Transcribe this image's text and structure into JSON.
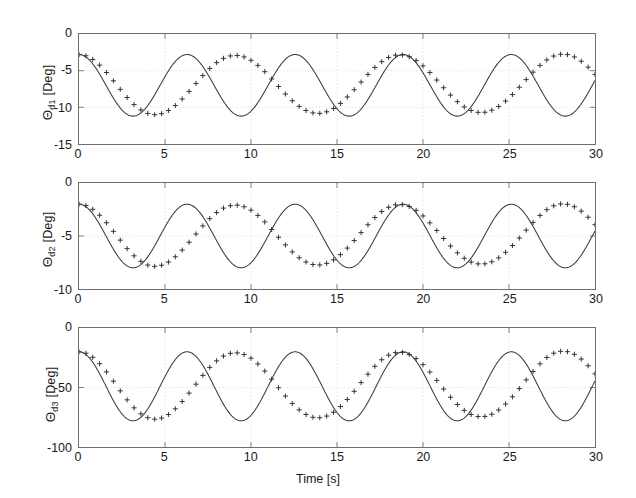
{
  "figure": {
    "background": "#ffffff",
    "axis_color": "#6f6f6f",
    "line_color": "#3a3a3a",
    "grid_color": "#cccccc",
    "marker": "plus"
  },
  "xaxis": {
    "label": "Time [s]",
    "ticks": [
      0,
      5,
      10,
      15,
      20,
      25,
      30
    ],
    "tick_labels": [
      "0",
      "5",
      "10",
      "15",
      "20",
      "25",
      "30"
    ],
    "min": 0,
    "max": 30
  },
  "subplots": [
    {
      "id": "subplot-theta-d1",
      "ylabel_theta": "Θ",
      "ylabel_sub": "d1",
      "ylabel_unit": " [Deg]",
      "ylabel_full": "Θd1 [Deg]",
      "ticks": [
        0,
        -5,
        -10,
        -15
      ],
      "tick_labels": [
        "0",
        "-5",
        "-10",
        "-15"
      ],
      "min": -15,
      "max": 0
    },
    {
      "id": "subplot-theta-d2",
      "ylabel_theta": "Θ",
      "ylabel_sub": "d2",
      "ylabel_unit": " [Deg]",
      "ylabel_full": "Θd2 [Deg]",
      "ticks": [
        0,
        -5,
        -10
      ],
      "tick_labels": [
        "0",
        "-5",
        "-10"
      ],
      "min": -10,
      "max": 0
    },
    {
      "id": "subplot-theta-d3",
      "ylabel_theta": "Θ",
      "ylabel_sub": "d3",
      "ylabel_unit": " [Deg]",
      "ylabel_full": "Θd3 [Deg]",
      "ticks": [
        0,
        -50,
        -100
      ],
      "tick_labels": [
        "0",
        "-50",
        "-100"
      ],
      "min": -100,
      "max": 0
    }
  ],
  "chart_data": [
    {
      "type": "line",
      "title": "",
      "xlabel": "Time [s]",
      "ylabel": "Θd1 [Deg]",
      "xlim": [
        0,
        30
      ],
      "ylim": [
        -15,
        0
      ],
      "xticks": [
        0,
        5,
        10,
        15,
        20,
        25,
        30
      ],
      "yticks": [
        0,
        -5,
        -10,
        -15
      ],
      "grid": true,
      "marker": "+",
      "legend": null,
      "waveform": {
        "shape": "sinusoid",
        "mean": -7.0,
        "amplitude": 4.2,
        "period": 6.283,
        "phase_deg": 90,
        "note": "y = -7.0 + 4.2*cos(2*pi*t/6.283); max -2.8, min -11.2"
      },
      "x": [
        0.0,
        0.4,
        0.8,
        1.2,
        1.6,
        2.0,
        2.4,
        2.8,
        3.2,
        3.6,
        4.0,
        4.4,
        4.8,
        5.2,
        5.6,
        6.0,
        6.4,
        6.8,
        7.2,
        7.6,
        8.0,
        8.4,
        8.8,
        9.2,
        9.6,
        10.0,
        10.4,
        10.8,
        11.2,
        11.6,
        12.0,
        12.4,
        12.8,
        13.2,
        13.6,
        14.0,
        14.4,
        14.8,
        15.2,
        15.6,
        16.0,
        16.4,
        16.8,
        17.2,
        17.6,
        18.0,
        18.4,
        18.8,
        19.2,
        19.6,
        20.0,
        20.4,
        20.8,
        21.2,
        21.6,
        22.0,
        22.4,
        22.8,
        23.2,
        23.6,
        24.0,
        24.4,
        24.8,
        25.2,
        25.6,
        26.0,
        26.4,
        26.8,
        27.2,
        27.6,
        28.0,
        28.4,
        28.8,
        29.2,
        29.6,
        30.0
      ],
      "y": [
        -2.8,
        -2.97,
        -3.47,
        -4.25,
        -5.25,
        -6.38,
        -7.55,
        -8.66,
        -9.62,
        -10.35,
        -10.83,
        -11.0,
        -10.87,
        -10.44,
        -9.75,
        -8.86,
        -7.83,
        -6.74,
        -5.67,
        -4.7,
        -3.9,
        -3.32,
        -2.99,
        -2.93,
        -3.13,
        -3.59,
        -4.28,
        -5.14,
        -6.13,
        -7.16,
        -8.18,
        -9.1,
        -9.87,
        -10.43,
        -10.76,
        -10.82,
        -10.61,
        -10.15,
        -9.46,
        -8.59,
        -7.6,
        -6.55,
        -5.51,
        -4.56,
        -3.77,
        -3.2,
        -2.89,
        -2.86,
        -3.1,
        -3.61,
        -4.35,
        -5.26,
        -6.28,
        -7.33,
        -8.33,
        -9.23,
        -9.94,
        -10.44,
        -10.68,
        -10.67,
        -10.4,
        -9.88,
        -9.15,
        -8.26,
        -7.26,
        -6.22,
        -5.2,
        -4.28,
        -3.53,
        -3.01,
        -2.77,
        -2.81,
        -3.13,
        -3.71,
        -4.52,
        -5.5
      ]
    },
    {
      "type": "line",
      "title": "",
      "xlabel": "Time [s]",
      "ylabel": "Θd2 [Deg]",
      "xlim": [
        0,
        30
      ],
      "ylim": [
        -10,
        0
      ],
      "xticks": [
        0,
        5,
        10,
        15,
        20,
        25,
        30
      ],
      "yticks": [
        0,
        -5,
        -10
      ],
      "grid": true,
      "marker": "+",
      "legend": null,
      "waveform": {
        "shape": "sinusoid",
        "mean": -5.0,
        "amplitude": 3.0,
        "period": 6.283,
        "phase_deg": 90,
        "note": "y = -5.0 + 3.0*cos(2*pi*t/6.283); max -2.0, min -8.0"
      },
      "x": [
        0.0,
        0.4,
        0.8,
        1.2,
        1.6,
        2.0,
        2.4,
        2.8,
        3.2,
        3.6,
        4.0,
        4.4,
        4.8,
        5.2,
        5.6,
        6.0,
        6.4,
        6.8,
        7.2,
        7.6,
        8.0,
        8.4,
        8.8,
        9.2,
        9.6,
        10.0,
        10.4,
        10.8,
        11.2,
        11.6,
        12.0,
        12.4,
        12.8,
        13.2,
        13.6,
        14.0,
        14.4,
        14.8,
        15.2,
        15.6,
        16.0,
        16.4,
        16.8,
        17.2,
        17.6,
        18.0,
        18.4,
        18.8,
        19.2,
        19.6,
        20.0,
        20.4,
        20.8,
        21.2,
        21.6,
        22.0,
        22.4,
        22.8,
        23.2,
        23.6,
        24.0,
        24.4,
        24.8,
        25.2,
        25.6,
        26.0,
        26.4,
        26.8,
        27.2,
        27.6,
        28.0,
        28.4,
        28.8,
        29.2,
        29.6,
        30.0
      ],
      "y": [
        -2.0,
        -2.12,
        -2.48,
        -3.04,
        -3.75,
        -4.56,
        -5.39,
        -6.19,
        -6.87,
        -7.39,
        -7.74,
        -7.86,
        -7.76,
        -7.46,
        -6.96,
        -6.33,
        -5.59,
        -4.81,
        -4.05,
        -3.36,
        -2.79,
        -2.37,
        -2.14,
        -2.09,
        -2.24,
        -2.56,
        -3.06,
        -3.67,
        -4.38,
        -5.12,
        -5.84,
        -6.5,
        -7.05,
        -7.45,
        -7.69,
        -7.73,
        -7.58,
        -7.25,
        -6.76,
        -6.14,
        -5.43,
        -4.68,
        -3.94,
        -3.26,
        -2.69,
        -2.29,
        -2.06,
        -2.04,
        -2.22,
        -2.58,
        -3.11,
        -3.76,
        -4.48,
        -5.24,
        -5.95,
        -6.59,
        -7.1,
        -7.46,
        -7.63,
        -7.62,
        -7.43,
        -7.06,
        -6.54,
        -5.9,
        -5.19,
        -4.45,
        -3.72,
        -3.06,
        -2.52,
        -2.15,
        -1.98,
        -2.01,
        -2.24,
        -2.65,
        -3.23,
        -3.93
      ]
    },
    {
      "type": "line",
      "title": "",
      "xlabel": "Time [s]",
      "ylabel": "Θd3 [Deg]",
      "xlim": [
        0,
        30
      ],
      "ylim": [
        -100,
        0
      ],
      "xticks": [
        0,
        5,
        10,
        15,
        20,
        25,
        30
      ],
      "yticks": [
        0,
        -50,
        -100
      ],
      "grid": true,
      "marker": "+",
      "legend": null,
      "waveform": {
        "shape": "sinusoid",
        "mean": -49.0,
        "amplitude": 29.0,
        "period": 6.283,
        "phase_deg": 90,
        "note": "y = -49 + 29*cos(2*pi*t/6.283); max -20, min -78"
      },
      "x": [
        0.0,
        0.4,
        0.8,
        1.2,
        1.6,
        2.0,
        2.4,
        2.8,
        3.2,
        3.6,
        4.0,
        4.4,
        4.8,
        5.2,
        5.6,
        6.0,
        6.4,
        6.8,
        7.2,
        7.6,
        8.0,
        8.4,
        8.8,
        9.2,
        9.6,
        10.0,
        10.4,
        10.8,
        11.2,
        11.6,
        12.0,
        12.4,
        12.8,
        13.2,
        13.6,
        14.0,
        14.4,
        14.8,
        15.2,
        15.6,
        16.0,
        16.4,
        16.8,
        17.2,
        17.6,
        18.0,
        18.4,
        18.8,
        19.2,
        19.6,
        20.0,
        20.4,
        20.8,
        21.2,
        21.6,
        22.0,
        22.4,
        22.8,
        23.2,
        23.6,
        24.0,
        24.4,
        24.8,
        25.2,
        25.6,
        26.0,
        26.4,
        26.8,
        27.2,
        27.6,
        28.0,
        28.4,
        28.8,
        29.2,
        29.6,
        30.0
      ],
      "y": [
        -20.0,
        -21.2,
        -24.6,
        -30.0,
        -36.9,
        -44.7,
        -52.8,
        -60.4,
        -67.1,
        -72.1,
        -75.4,
        -76.6,
        -75.7,
        -72.7,
        -67.9,
        -61.8,
        -54.7,
        -47.2,
        -39.8,
        -33.1,
        -27.6,
        -23.6,
        -21.3,
        -20.9,
        -22.3,
        -25.4,
        -30.2,
        -36.2,
        -43.0,
        -50.2,
        -57.2,
        -63.5,
        -68.8,
        -72.7,
        -75.0,
        -75.4,
        -74.0,
        -70.8,
        -66.0,
        -60.1,
        -53.2,
        -45.9,
        -38.8,
        -32.2,
        -26.7,
        -22.8,
        -20.7,
        -20.5,
        -22.2,
        -25.7,
        -30.8,
        -37.0,
        -44.0,
        -51.3,
        -58.2,
        -64.3,
        -69.2,
        -72.7,
        -74.4,
        -74.3,
        -72.5,
        -68.9,
        -63.9,
        -57.8,
        -50.9,
        -43.6,
        -36.5,
        -30.1,
        -24.8,
        -21.2,
        -19.6,
        -19.9,
        -22.1,
        -26.1,
        -31.7,
        -38.5
      ]
    }
  ]
}
